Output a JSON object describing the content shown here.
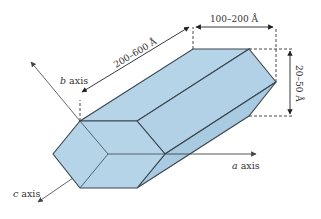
{
  "diagram": {
    "colors": {
      "face_fill": "#b6d4e8",
      "edge": "#3a4550",
      "axis": "#555555",
      "dashed": "#333333",
      "background": "#ffffff"
    },
    "axes": {
      "a": {
        "italic": "a",
        "rest": " axis"
      },
      "b": {
        "italic": "b",
        "rest": " axis"
      },
      "c": {
        "italic": "c",
        "rest": " axis"
      }
    },
    "dimensions": {
      "length": "200–600 Å",
      "width": "100–200 Å",
      "thickness": "20–50 Å"
    }
  }
}
